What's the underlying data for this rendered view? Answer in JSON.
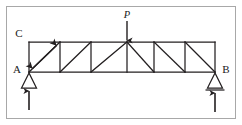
{
  "figure": {
    "kind": "statics-truss-free-body-diagram",
    "background_color": "#ffffff",
    "line_color": "#231f20",
    "frame_color": "#a8a8a8",
    "labels": {
      "top_left_joint": "C",
      "left_support": "A",
      "right_support": "B",
      "applied_load": "P"
    },
    "structure": {
      "truss_type": "parallel chord truss",
      "span_panels": 6,
      "top_chord": "present",
      "bottom_chord": "present",
      "verticals": 7,
      "diagonals": 6,
      "diagonal_pattern_left_half": "rising left to right",
      "diagonal_pattern_right_half": "falling left to right"
    },
    "supports": {
      "left": {
        "label": "A",
        "type": "pin",
        "reaction": "upward"
      },
      "right": {
        "label": "B",
        "type": "roller",
        "reaction": "upward"
      }
    },
    "loads": [
      {
        "label": "P",
        "direction": "downward",
        "location": "midspan top chord joint"
      }
    ],
    "annotations": [
      {
        "name": "member-length-dimension",
        "type": "double-headed arrow",
        "along": "first panel diagonal from joint A to top chord joint"
      }
    ],
    "geometry": {
      "top_chord_y": 42,
      "bottom_chord_y": 72,
      "left_x": 29,
      "right_x": 215,
      "panel_x": [
        29,
        60,
        91,
        127,
        154,
        185,
        215
      ]
    }
  }
}
